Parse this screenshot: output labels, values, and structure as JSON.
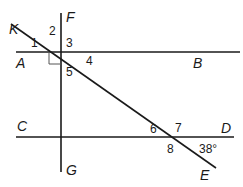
{
  "figure": {
    "stroke_color": "#1a1a1a",
    "lines": [
      {
        "id": "AB",
        "x1": 16,
        "y1": 52,
        "x2": 240,
        "y2": 52
      },
      {
        "id": "CD",
        "x1": 16,
        "y1": 137,
        "x2": 234,
        "y2": 137
      },
      {
        "id": "FG",
        "x1": 61,
        "y1": 13,
        "x2": 61,
        "y2": 172
      },
      {
        "id": "KE",
        "x1": 11,
        "y1": 24,
        "x2": 216,
        "y2": 168
      }
    ],
    "point_labels": [
      {
        "text": "K",
        "x": 9,
        "y": 34
      },
      {
        "text": "F",
        "x": 66,
        "y": 22
      },
      {
        "text": "A",
        "x": 16,
        "y": 68
      },
      {
        "text": "B",
        "x": 193,
        "y": 68
      },
      {
        "text": "C",
        "x": 17,
        "y": 131
      },
      {
        "text": "D",
        "x": 221,
        "y": 133
      },
      {
        "text": "G",
        "x": 66,
        "y": 175
      },
      {
        "text": "E",
        "x": 200,
        "y": 180
      }
    ],
    "angle_labels": [
      {
        "text": "1",
        "x": 31,
        "y": 47
      },
      {
        "text": "2",
        "x": 49,
        "y": 35
      },
      {
        "text": "3",
        "x": 66,
        "y": 47
      },
      {
        "text": "4",
        "x": 86,
        "y": 65
      },
      {
        "text": "5",
        "x": 66,
        "y": 76
      },
      {
        "text": "6",
        "x": 150,
        "y": 133
      },
      {
        "text": "7",
        "x": 175,
        "y": 132
      },
      {
        "text": "8",
        "x": 167,
        "y": 153
      },
      {
        "text": "38°",
        "x": 199,
        "y": 153
      }
    ],
    "right_angle_mark": {
      "x": 49,
      "y": 52,
      "size": 12
    }
  }
}
